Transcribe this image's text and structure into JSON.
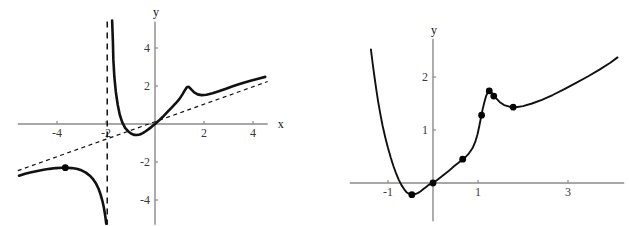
{
  "figure": {
    "title": "",
    "panel_count": 2
  },
  "chart_data": [
    {
      "id": "left-plot",
      "type": "line",
      "title": "",
      "xlabel": "x",
      "ylabel": "y",
      "xlim": [
        -5.6,
        4.6
      ],
      "ylim": [
        -5.3,
        5.4
      ],
      "grid": false,
      "legend": "none",
      "xticks": [
        -4,
        -2,
        2,
        4
      ],
      "xtick_labels": [
        "-4",
        "-2",
        "2",
        "4"
      ],
      "yticks": [
        -4,
        -2,
        2,
        4
      ],
      "ytick_labels": [
        "-4",
        "-2",
        "2",
        "4"
      ],
      "annotations": [
        {
          "name": "vertical-asymptote",
          "style": "dashed",
          "x": -1.95
        },
        {
          "name": "oblique-asymptote",
          "style": "dashed",
          "slope": 0.46,
          "intercept": 0.12
        }
      ],
      "series": [
        {
          "name": "branch-upper-right",
          "style": "solid-thick",
          "points": [
            [
              -1.75,
              5.45
            ],
            [
              -1.72,
              4.4
            ],
            [
              -1.7,
              3.4
            ],
            [
              -1.66,
              2.5
            ],
            [
              -1.6,
              1.7
            ],
            [
              -1.52,
              1.0
            ],
            [
              -1.44,
              0.5
            ],
            [
              -1.34,
              0.1
            ],
            [
              -1.22,
              -0.2
            ],
            [
              -1.1,
              -0.38
            ],
            [
              -0.98,
              -0.5
            ],
            [
              -0.86,
              -0.57
            ],
            [
              -0.74,
              -0.58
            ],
            [
              -0.62,
              -0.55
            ],
            [
              -0.5,
              -0.48
            ],
            [
              -0.38,
              -0.38
            ],
            [
              -0.26,
              -0.27
            ],
            [
              -0.14,
              -0.15
            ],
            [
              0.0,
              0.0
            ],
            [
              0.16,
              0.18
            ],
            [
              0.32,
              0.38
            ],
            [
              0.5,
              0.62
            ],
            [
              0.68,
              0.86
            ],
            [
              0.84,
              1.08
            ],
            [
              1.0,
              1.32
            ],
            [
              1.12,
              1.56
            ],
            [
              1.22,
              1.78
            ],
            [
              1.3,
              1.93
            ],
            [
              1.38,
              1.96
            ],
            [
              1.48,
              1.82
            ],
            [
              1.6,
              1.66
            ],
            [
              1.74,
              1.56
            ],
            [
              1.9,
              1.52
            ],
            [
              2.1,
              1.54
            ],
            [
              2.35,
              1.62
            ],
            [
              2.6,
              1.72
            ],
            [
              2.9,
              1.86
            ],
            [
              3.2,
              2.0
            ],
            [
              3.55,
              2.14
            ],
            [
              3.9,
              2.28
            ],
            [
              4.25,
              2.4
            ],
            [
              4.5,
              2.48
            ]
          ]
        },
        {
          "name": "branch-lower-left",
          "style": "solid-thick",
          "points": [
            [
              -5.55,
              -2.72
            ],
            [
              -5.3,
              -2.62
            ],
            [
              -5.05,
              -2.54
            ],
            [
              -4.8,
              -2.47
            ],
            [
              -4.55,
              -2.41
            ],
            [
              -4.3,
              -2.36
            ],
            [
              -4.05,
              -2.32
            ],
            [
              -3.8,
              -2.3
            ],
            [
              -3.6,
              -2.3
            ],
            [
              -3.4,
              -2.32
            ],
            [
              -3.2,
              -2.36
            ],
            [
              -3.0,
              -2.44
            ],
            [
              -2.82,
              -2.56
            ],
            [
              -2.66,
              -2.72
            ],
            [
              -2.52,
              -2.92
            ],
            [
              -2.4,
              -3.15
            ],
            [
              -2.3,
              -3.42
            ],
            [
              -2.22,
              -3.72
            ],
            [
              -2.14,
              -4.08
            ],
            [
              -2.08,
              -4.45
            ],
            [
              -2.03,
              -4.85
            ],
            [
              -1.99,
              -5.25
            ]
          ]
        }
      ],
      "markers": [
        {
          "name": "local-max-point",
          "x": -3.66,
          "y": -2.3,
          "r": 3.4
        }
      ]
    },
    {
      "id": "right-plot",
      "type": "line",
      "title": "",
      "xlabel": "x",
      "ylabel": "y",
      "xlim": [
        -1.85,
        4.25
      ],
      "ylim": [
        -0.72,
        2.72
      ],
      "grid": false,
      "legend": "none",
      "xticks": [
        -1,
        1,
        3
      ],
      "xtick_labels": [
        "-1",
        "1",
        "3"
      ],
      "yticks": [
        1,
        2
      ],
      "ytick_labels": [
        "1",
        "2"
      ],
      "annotations": [],
      "series": [
        {
          "name": "main-curve",
          "style": "solid-thin",
          "points": [
            [
              -1.38,
              2.52
            ],
            [
              -1.34,
              2.25
            ],
            [
              -1.3,
              2.0
            ],
            [
              -1.26,
              1.76
            ],
            [
              -1.22,
              1.54
            ],
            [
              -1.17,
              1.3
            ],
            [
              -1.12,
              1.08
            ],
            [
              -1.06,
              0.86
            ],
            [
              -1.0,
              0.66
            ],
            [
              -0.94,
              0.48
            ],
            [
              -0.88,
              0.32
            ],
            [
              -0.82,
              0.18
            ],
            [
              -0.76,
              0.06
            ],
            [
              -0.7,
              -0.04
            ],
            [
              -0.64,
              -0.12
            ],
            [
              -0.58,
              -0.18
            ],
            [
              -0.52,
              -0.21
            ],
            [
              -0.46,
              -0.22
            ],
            [
              -0.4,
              -0.21
            ],
            [
              -0.34,
              -0.19
            ],
            [
              -0.28,
              -0.16
            ],
            [
              -0.22,
              -0.12
            ],
            [
              -0.16,
              -0.08
            ],
            [
              -0.1,
              -0.04
            ],
            [
              -0.04,
              -0.01
            ],
            [
              0.0,
              0.0
            ],
            [
              0.1,
              0.06
            ],
            [
              0.22,
              0.14
            ],
            [
              0.34,
              0.22
            ],
            [
              0.46,
              0.31
            ],
            [
              0.58,
              0.39
            ],
            [
              0.7,
              0.47
            ],
            [
              0.8,
              0.56
            ],
            [
              0.88,
              0.66
            ],
            [
              0.94,
              0.78
            ],
            [
              0.99,
              0.92
            ],
            [
              1.03,
              1.08
            ],
            [
              1.07,
              1.25
            ],
            [
              1.1,
              1.38
            ],
            [
              1.14,
              1.52
            ],
            [
              1.18,
              1.64
            ],
            [
              1.22,
              1.72
            ],
            [
              1.26,
              1.74
            ],
            [
              1.3,
              1.71
            ],
            [
              1.34,
              1.67
            ],
            [
              1.4,
              1.6
            ],
            [
              1.48,
              1.53
            ],
            [
              1.58,
              1.47
            ],
            [
              1.7,
              1.44
            ],
            [
              1.84,
              1.43
            ],
            [
              2.0,
              1.45
            ],
            [
              2.2,
              1.5
            ],
            [
              2.42,
              1.57
            ],
            [
              2.66,
              1.66
            ],
            [
              2.92,
              1.77
            ],
            [
              3.18,
              1.89
            ],
            [
              3.44,
              2.01
            ],
            [
              3.7,
              2.14
            ],
            [
              3.94,
              2.27
            ],
            [
              4.1,
              2.37
            ]
          ]
        }
      ],
      "markers": [
        {
          "name": "minimum-point",
          "x": -0.47,
          "y": -0.22,
          "r": 3.4
        },
        {
          "name": "origin-point",
          "x": 0.0,
          "y": 0.0,
          "r": 3.4
        },
        {
          "name": "rise-point",
          "x": 0.66,
          "y": 0.45,
          "r": 3.4
        },
        {
          "name": "pre-peak-point",
          "x": 1.08,
          "y": 1.28,
          "r": 3.4
        },
        {
          "name": "peak-point",
          "x": 1.25,
          "y": 1.74,
          "r": 3.4
        },
        {
          "name": "post-peak-point",
          "x": 1.35,
          "y": 1.64,
          "r": 3.4
        },
        {
          "name": "trough-point",
          "x": 1.78,
          "y": 1.43,
          "r": 3.4
        }
      ]
    }
  ],
  "colors": {
    "curve": "#111111",
    "axis": "#8a8a8a",
    "tick_label": "#3a3a3a",
    "marker": "#050505",
    "background": "#ffffff"
  }
}
